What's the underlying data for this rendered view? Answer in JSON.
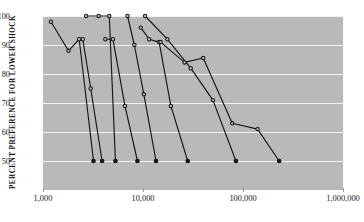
{
  "chart_data": {
    "type": "line",
    "title": "",
    "xlabel": "",
    "ylabel": "PERCENT PREFERENCE FOR LOWER SHOCK",
    "xscale": "log",
    "xlim": [
      1000,
      1000000
    ],
    "ylim": [
      44,
      103
    ],
    "grid": true,
    "legend": "none",
    "background": "#b9b9b9",
    "line_color": "#151515",
    "gridline_color": "#f2f2f2",
    "yticks": [
      100,
      90,
      80,
      70,
      60,
      50
    ],
    "ytick_labels": [
      "100",
      "90",
      "80",
      "70",
      "60",
      "50"
    ],
    "xticks": [
      1000,
      10000,
      100000,
      1000000
    ],
    "xtick_labels": [
      "1,000",
      "10,000",
      "100,000",
      "1,000,000"
    ],
    "marker": "circle",
    "series": [
      {
        "name": "series-1",
        "x": [
          1200,
          1800,
          2300,
          3200
        ],
        "y": [
          98,
          88,
          92,
          50
        ],
        "marker_filled": [
          false,
          false,
          false,
          true
        ]
      },
      {
        "name": "series-2",
        "x": [
          2500,
          3000,
          3900
        ],
        "y": [
          92,
          75,
          50
        ],
        "marker_filled": [
          false,
          false,
          true
        ]
      },
      {
        "name": "series-3",
        "x": [
          2700,
          3600,
          4600,
          5300
        ],
        "y": [
          100,
          100,
          100,
          50
        ],
        "marker_filled": [
          false,
          false,
          false,
          true
        ]
      },
      {
        "name": "series-4",
        "x": [
          4200,
          5000,
          6600,
          8800
        ],
        "y": [
          92,
          92,
          69,
          50
        ],
        "marker_filled": [
          false,
          false,
          false,
          true
        ]
      },
      {
        "name": "series-5",
        "x": [
          7000,
          8200,
          10200,
          13500
        ],
        "y": [
          100,
          90,
          73,
          50
        ],
        "marker_filled": [
          false,
          false,
          false,
          true
        ]
      },
      {
        "name": "series-6",
        "x": [
          9500,
          11500,
          14500,
          19000,
          28000
        ],
        "y": [
          96,
          92,
          91,
          69,
          50
        ],
        "marker_filled": [
          false,
          false,
          false,
          false,
          true
        ]
      },
      {
        "name": "series-7",
        "x": [
          10500,
          17500,
          30000,
          50000,
          85000
        ],
        "y": [
          100,
          92,
          82,
          71,
          50
        ],
        "marker_filled": [
          false,
          false,
          false,
          false,
          true
        ]
      },
      {
        "name": "series-8",
        "x": [
          15000,
          26000,
          40000,
          78000,
          140000,
          230000
        ],
        "y": [
          91,
          84,
          85.5,
          63,
          61,
          50
        ],
        "marker_filled": [
          false,
          false,
          false,
          false,
          false,
          true
        ]
      }
    ]
  }
}
